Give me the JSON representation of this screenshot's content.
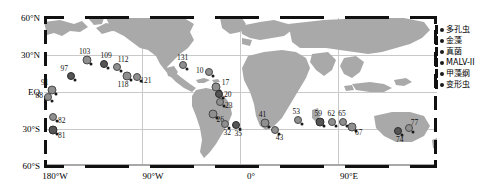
{
  "chart_data": {
    "type": "scatter",
    "title": "",
    "xlabel": "",
    "ylabel": "",
    "projection": "equirectangular world map",
    "xlim": [
      -180,
      180
    ],
    "ylim": [
      -60,
      60
    ],
    "grid": true,
    "legend_position": "right",
    "axes": {
      "y_ticks": [
        "60°N",
        "30°N",
        "EQ",
        "30°S",
        "60°S"
      ],
      "y_tick_values": [
        60,
        30,
        0,
        -30,
        -60
      ],
      "x_ticks": [
        "180°W",
        "90°W",
        "0°",
        "90°E"
      ],
      "x_tick_values": [
        -180,
        -90,
        0,
        90
      ]
    },
    "legend": [
      {
        "label": "多孔虫",
        "marker": "circle"
      },
      {
        "label": "金藻",
        "marker": "circle"
      },
      {
        "label": "真菌",
        "marker": "circle"
      },
      {
        "label": "MALV-II",
        "marker": "circle"
      },
      {
        "label": "甲藻纲",
        "marker": "circle"
      },
      {
        "label": "变形虫",
        "marker": "circle"
      }
    ],
    "points": [
      {
        "label": "103",
        "lon": -141,
        "lat": 26
      },
      {
        "label": "109",
        "lon": -125,
        "lat": 23
      },
      {
        "label": "112",
        "lon": -113,
        "lat": 20
      },
      {
        "label": "118",
        "lon": -104,
        "lat": 13
      },
      {
        "label": "121",
        "lon": -95,
        "lat": 12
      },
      {
        "label": "97",
        "lon": -155,
        "lat": 13
      },
      {
        "label": "91",
        "lon": -173,
        "lat": 2
      },
      {
        "label": "88",
        "lon": -176,
        "lat": -4
      },
      {
        "label": "82",
        "lon": -172,
        "lat": -20
      },
      {
        "label": "81",
        "lon": -172,
        "lat": -31
      },
      {
        "label": "131",
        "lon": -53,
        "lat": 22
      },
      {
        "label": "10",
        "lon": -29,
        "lat": 16
      },
      {
        "label": "17",
        "lon": -22,
        "lat": 4
      },
      {
        "label": "20",
        "lon": -20,
        "lat": -2
      },
      {
        "label": "23",
        "lon": -19,
        "lat": -8
      },
      {
        "label": "26",
        "lon": -25,
        "lat": -18
      },
      {
        "label": "32",
        "lon": -14,
        "lat": -26
      },
      {
        "label": "35",
        "lon": -4,
        "lat": -27
      },
      {
        "label": "41",
        "lon": 22,
        "lat": -25
      },
      {
        "label": "43",
        "lon": 32,
        "lat": -31
      },
      {
        "label": "53",
        "lon": 53,
        "lat": -23
      },
      {
        "label": "59",
        "lon": 73,
        "lat": -24
      },
      {
        "label": "62",
        "lon": 84,
        "lat": -24
      },
      {
        "label": "65",
        "lon": 94,
        "lat": -24
      },
      {
        "label": "67",
        "lon": 102,
        "lat": -28
      },
      {
        "label": "74",
        "lon": 144,
        "lat": -32
      },
      {
        "label": "77",
        "lon": 154,
        "lat": -29
      }
    ]
  }
}
